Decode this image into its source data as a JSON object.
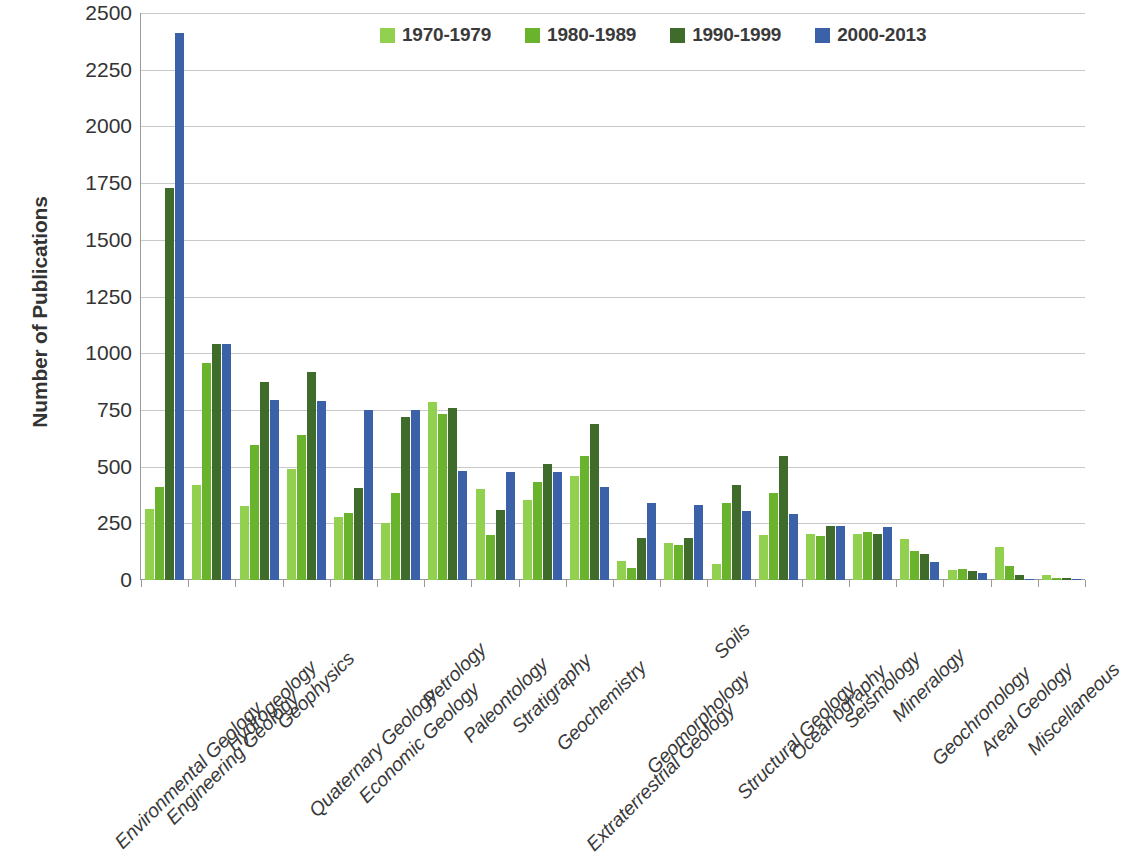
{
  "chart_data": {
    "type": "bar",
    "title": "",
    "xlabel": "",
    "ylabel": "Number of Publications",
    "ylim": [
      0,
      2500
    ],
    "ytick_step": 250,
    "yticks": [
      "0",
      "250",
      "500",
      "750",
      "1000",
      "1250",
      "1500",
      "1750",
      "2000",
      "2250",
      "2500"
    ],
    "grid": "horizontal",
    "legend_position": "top-center",
    "categories": [
      "Environmental Geology",
      "Engineering Geology",
      "Hydrogeology",
      "Geophysics",
      "Quaternary Geology",
      "Economic Geology",
      "Petrology",
      "Paleontology",
      "Stratigraphy",
      "Geochemistry",
      "Extraterrestrial Geology",
      "Geomorphology",
      "Soils",
      "Structural Geology",
      "Oceanography",
      "Seismology",
      "Mineralogy",
      "Geochronology",
      "Areal Geology",
      "Miscellaneous"
    ],
    "series": [
      {
        "name": "1970-1979",
        "color": "#92d050",
        "values": [
          315,
          420,
          325,
          490,
          280,
          250,
          785,
          400,
          355,
          460,
          85,
          165,
          70,
          200,
          205,
          205,
          180,
          45,
          145,
          20
        ]
      },
      {
        "name": "1980-1989",
        "color": "#6ab42d",
        "values": [
          410,
          955,
          595,
          640,
          295,
          385,
          730,
          200,
          430,
          545,
          55,
          155,
          340,
          385,
          195,
          210,
          130,
          50,
          60,
          10
        ]
      },
      {
        "name": "1990-1999",
        "color": "#3f6b2b",
        "values": [
          1730,
          1040,
          875,
          915,
          405,
          720,
          760,
          310,
          510,
          690,
          185,
          185,
          420,
          545,
          240,
          205,
          115,
          40,
          20,
          10
        ]
      },
      {
        "name": "2000-2013",
        "color": "#3b62a8",
        "values": [
          2410,
          1040,
          795,
          790,
          750,
          750,
          480,
          475,
          475,
          410,
          340,
          330,
          305,
          290,
          240,
          235,
          80,
          30,
          5,
          5
        ]
      }
    ]
  },
  "legend": {
    "items": [
      {
        "label": "1970-1979",
        "color": "#92d050"
      },
      {
        "label": "1980-1989",
        "color": "#6ab42d"
      },
      {
        "label": "1990-1999",
        "color": "#3f6b2b"
      },
      {
        "label": "2000-2013",
        "color": "#3b62a8"
      }
    ]
  },
  "axes": {
    "y_title": "Number of Publications"
  }
}
